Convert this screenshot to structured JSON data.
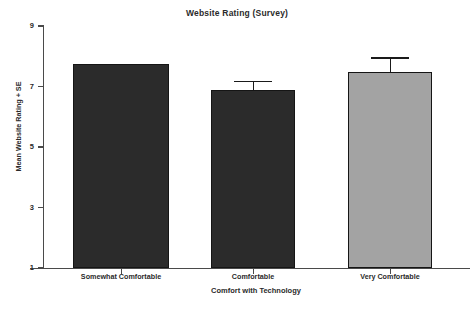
{
  "chart_data": {
    "type": "bar",
    "title": "Website Rating (Survey)",
    "xlabel": "Comfort with Technology",
    "ylabel": "Mean Website Rating + SE",
    "categories": [
      "Somewhat Comfortable",
      "Comfortable",
      "Very Comfortable"
    ],
    "values": [
      7.74,
      6.88,
      7.48
    ],
    "errors": [
      0.0,
      0.3,
      0.49
    ],
    "bar_colors": [
      "#2b2b2b",
      "#2b2b2b",
      "#a3a3a3"
    ],
    "ylim": [
      1,
      9
    ],
    "yticks": [
      1,
      3,
      5,
      7,
      9
    ],
    "ytick_labels": [
      "1",
      "3",
      "5",
      "7",
      "9"
    ],
    "grid": false,
    "legend": "none",
    "axis_color": "#4a4a4a"
  },
  "axis": {
    "y_label_0": "1",
    "y_label_1": "3",
    "y_label_2": "5",
    "y_label_3": "7",
    "y_label_4": "9"
  },
  "categories_text": {
    "cat_0": "Somewhat Comfortable",
    "cat_1": "Comfortable",
    "cat_2": "Very Comfortable"
  }
}
